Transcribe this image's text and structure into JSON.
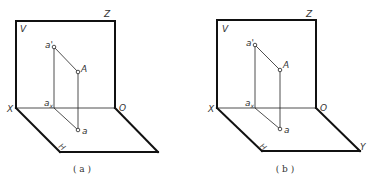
{
  "figures": [
    {
      "id": "a",
      "caption": "( a )",
      "caption_pos": [
        82,
        172
      ],
      "v_plane": {
        "tl": [
          16,
          21
        ],
        "tr": [
          115,
          21
        ],
        "bl": [
          16,
          108
        ],
        "br": [
          115,
          108
        ]
      },
      "h_plane": {
        "x": [
          16,
          108
        ],
        "o": [
          115,
          108
        ],
        "bl": [
          60,
          152
        ],
        "br": [
          158,
          152
        ]
      },
      "points": {
        "a_prime": [
          54,
          47
        ],
        "A": [
          78,
          72
        ],
        "a_x": [
          54,
          108
        ],
        "a": [
          78,
          130
        ]
      },
      "labels": {
        "V": {
          "text": "V",
          "pos": [
            20,
            32
          ]
        },
        "Z": {
          "text": "Z",
          "pos": [
            104,
            17
          ]
        },
        "X": {
          "text": "X",
          "pos": [
            7,
            112
          ]
        },
        "O": {
          "text": "O",
          "pos": [
            119,
            111
          ]
        },
        "a_prime": {
          "text": "a'",
          "pos": [
            45,
            48
          ]
        },
        "A": {
          "text": "A",
          "pos": [
            81,
            72
          ]
        },
        "a_x": {
          "text": "a",
          "sub": "x",
          "pos": [
            44,
            106
          ]
        },
        "a": {
          "text": "a",
          "pos": [
            82,
            134
          ]
        },
        "H": {
          "text": "H",
          "pos": [
            58,
            147
          ]
        },
        "Y": {
          "text": "",
          "pos": [
            0,
            0
          ]
        }
      }
    },
    {
      "id": "b",
      "caption": "( b )",
      "caption_pos": [
        285,
        172
      ],
      "v_plane": {
        "tl": [
          217,
          20
        ],
        "tr": [
          316,
          20
        ],
        "bl": [
          217,
          108
        ],
        "br": [
          316,
          108
        ]
      },
      "h_plane": {
        "x": [
          217,
          108
        ],
        "o": [
          316,
          108
        ],
        "bl": [
          262,
          151
        ],
        "br": [
          360,
          151
        ]
      },
      "points": {
        "a_prime": [
          255,
          45
        ],
        "A": [
          280,
          70
        ],
        "a_x": [
          255,
          108
        ],
        "a": [
          280,
          129
        ]
      },
      "labels": {
        "V": {
          "text": "V",
          "pos": [
            222,
            32
          ]
        },
        "Z": {
          "text": "Z",
          "pos": [
            306,
            17
          ]
        },
        "X": {
          "text": "X",
          "pos": [
            208,
            112
          ]
        },
        "O": {
          "text": "O",
          "pos": [
            320,
            111
          ]
        },
        "a_prime": {
          "text": "a'",
          "pos": [
            246,
            46
          ]
        },
        "A": {
          "text": "A",
          "pos": [
            283,
            68
          ]
        },
        "a_x": {
          "text": "a",
          "sub": "x",
          "pos": [
            245,
            106
          ]
        },
        "a": {
          "text": "a",
          "pos": [
            284,
            133
          ]
        },
        "H": {
          "text": "H",
          "pos": [
            259,
            147
          ]
        },
        "Y": {
          "text": "Y",
          "pos": [
            360,
            150
          ]
        }
      }
    }
  ]
}
